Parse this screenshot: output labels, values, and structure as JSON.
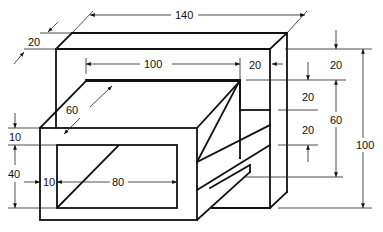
{
  "drawing": {
    "type": "dimensioned oblique technical drawing",
    "dimensions": {
      "overall_width": "140",
      "frame_depth": "20",
      "inner_opening_width": "100",
      "right_wall_thickness": "20",
      "front_box_depth": "60",
      "top_rail_height": "20",
      "middle_gap_upper": "20",
      "middle_gap_lower": "20",
      "opening_height": "60",
      "overall_height": "100",
      "front_top_wall": "10",
      "window_height": "40",
      "front_left_wall": "10",
      "window_width": "80"
    }
  }
}
